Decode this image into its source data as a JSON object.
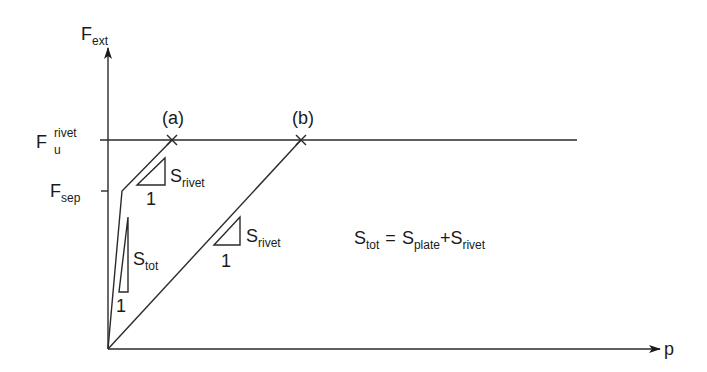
{
  "axes": {
    "y_label_main": "F",
    "y_label_sub": "ext",
    "x_label": "p"
  },
  "levels": {
    "fu_main": "F",
    "fu_sup": "rivet",
    "fu_sub": "u",
    "fsep_main": "F",
    "fsep_sub": "sep"
  },
  "points": {
    "a_label": "(a)",
    "b_label": "(b)"
  },
  "slope_triangles": [
    {
      "main": "S",
      "sub": "rivet",
      "run": "1"
    },
    {
      "main": "S",
      "sub": "tot",
      "run": "1"
    },
    {
      "main": "S",
      "sub": "rivet",
      "run": "1"
    }
  ],
  "equation": {
    "lhs_main": "S",
    "lhs_sub": "tot",
    "eq": "=",
    "t1_main": "S",
    "t1_sub": "plate",
    "plus": "+",
    "t2_main": "S",
    "t2_sub": "rivet"
  }
}
